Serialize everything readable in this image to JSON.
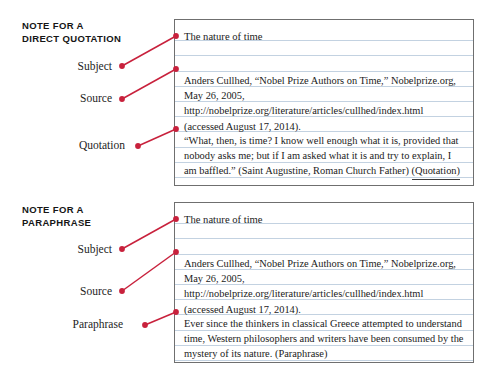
{
  "sections": [
    {
      "heading": "NOTE FOR A\nDIRECT QUOTATION",
      "labels": [
        {
          "text": "Subject"
        },
        {
          "text": "Source"
        },
        {
          "text": "Quotation"
        }
      ],
      "card": {
        "subject": "The nature of time",
        "source": "Anders Cullhed, “Nobel Prize Authors on Time,” Nobelprize.org, May 26, 2005, http://nobelprize.org/literature/articles/cullhed/index.html (accessed August 17, 2014).",
        "body": "“What, then, is time? I know well enough what it is, provided that nobody asks me; but if I am asked what it is and try to explain, I am baffled.” (Saint Augustine, Roman Church Father)",
        "body_tag": "(Quotation)"
      }
    },
    {
      "heading": "NOTE FOR A\nPARAPHRASE",
      "labels": [
        {
          "text": "Subject"
        },
        {
          "text": "Source"
        },
        {
          "text": "Paraphrase"
        }
      ],
      "card": {
        "subject": "The nature of time",
        "source": "Anders Cullhed, “Nobel Prize Authors on Time,” Nobelprize.org, May 26, 2005, http://nobelprize.org/literature/articles/cullhed/index.html (accessed August 17, 2014).",
        "body": "Ever since the thinkers in classical Greece attempted to understand time, Western philosophers and writers have been consumed by the mystery of its nature.",
        "body_tag": "(Paraphrase)"
      }
    }
  ],
  "colors": {
    "leader_line": "#c8213c",
    "card_border": "#6f6f6f",
    "rule_line": "#c3d2e1",
    "heading_text": "#161616",
    "body_text": "#1b1b1b"
  }
}
